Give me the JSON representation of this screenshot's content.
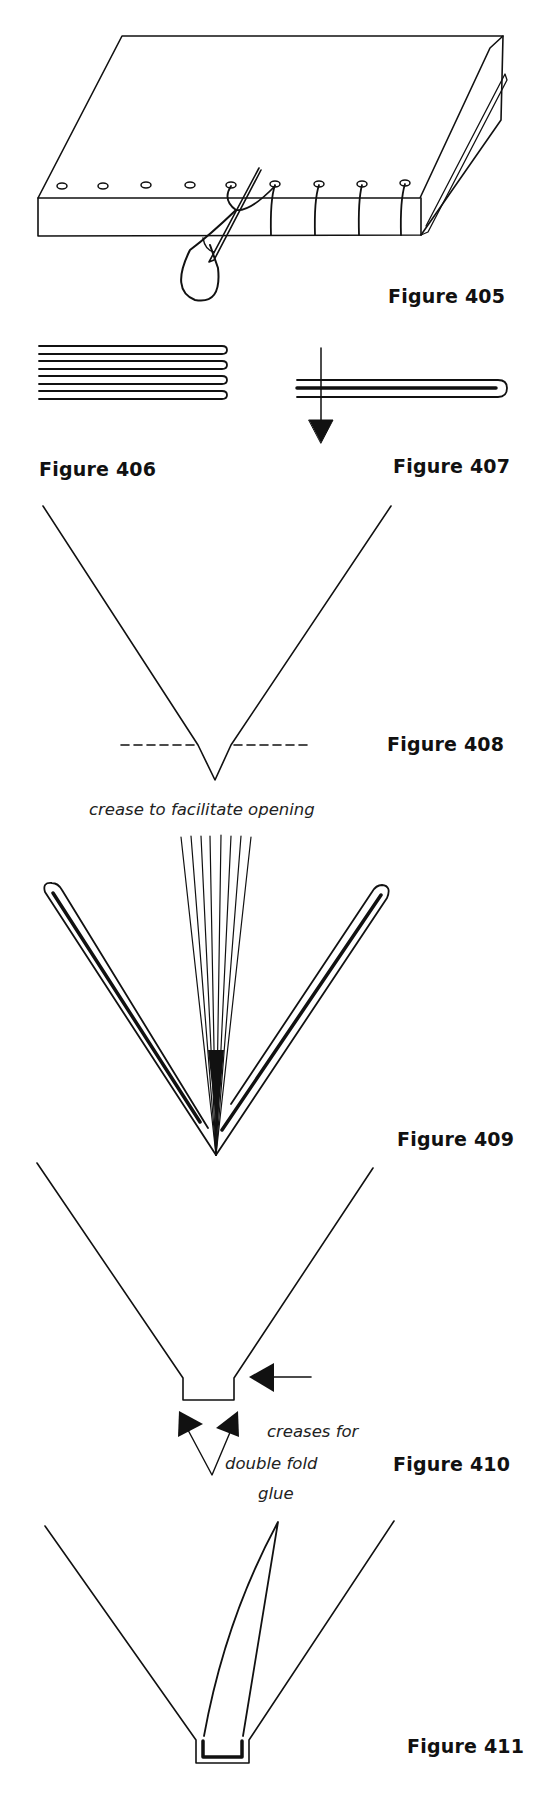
{
  "figures": [
    {
      "id": "405",
      "label": "Figure 405",
      "description": "book block with sewing holes and needle threading through"
    },
    {
      "id": "406",
      "label": "Figure 406",
      "description": "stack of folded sections"
    },
    {
      "id": "407",
      "label": "Figure 407",
      "description": "folded section with arrow indicating piercing"
    },
    {
      "id": "408",
      "label": "Figure 408",
      "description": "V-fold with dashed crease line",
      "caption": "crease to facilitate opening"
    },
    {
      "id": "409",
      "label": "Figure 409",
      "description": "fanned pages between two folded covers"
    },
    {
      "id": "410",
      "label": "Figure 410",
      "description": "spine with double fold creases",
      "caption_line1": "creases for",
      "caption_line2": "double fold"
    },
    {
      "id": "411",
      "label": "Figure 411",
      "description": "glued spine insert",
      "caption": "glue"
    }
  ],
  "colors": {
    "ink": "#111111",
    "paper": "#ffffff"
  }
}
